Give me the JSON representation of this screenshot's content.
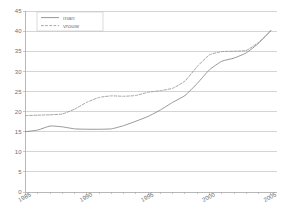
{
  "chart_data": {
    "type": "line",
    "title": "",
    "subtitle": "",
    "xlabel": "",
    "ylabel": "",
    "xlim": [
      1985,
      2005.5
    ],
    "ylim": [
      0,
      45
    ],
    "ytick_step": 5,
    "grid": true,
    "grid_axis": "y",
    "legend_position": "top-left",
    "x_tick_interval_minor": 1,
    "x_tick_interval_major": 5,
    "xticks": [
      1985,
      1990,
      1995,
      2000,
      2005
    ],
    "xtick_labels": [
      "1985",
      "1990",
      "1995",
      "2000",
      "2005"
    ],
    "yticks": [
      0,
      5,
      10,
      15,
      20,
      25,
      30,
      35,
      40,
      45
    ],
    "ytick_labels": [
      "0",
      "5",
      "10",
      "15",
      "20",
      "25",
      "30",
      "35",
      "40",
      "45"
    ],
    "x": [
      1985,
      1986,
      1987,
      1988,
      1989,
      1990,
      1991,
      1992,
      1993,
      1994,
      1995,
      1996,
      1997,
      1998,
      1999,
      2000,
      2001,
      2002,
      2003,
      2004,
      2005
    ],
    "series": [
      {
        "name": "man",
        "style": "solid",
        "color": "#8a8a8a",
        "values": [
          15.0,
          15.4,
          16.4,
          16.2,
          15.7,
          15.6,
          15.6,
          15.7,
          16.5,
          17.6,
          18.8,
          20.4,
          22.3,
          24.0,
          27.0,
          30.4,
          32.5,
          33.3,
          34.6,
          37.0,
          40.2
        ]
      },
      {
        "name": "vrouw",
        "style": "dashed",
        "color": "#9a9a9a",
        "values": [
          19.0,
          19.1,
          19.2,
          19.4,
          20.6,
          22.3,
          23.5,
          23.9,
          23.8,
          24.0,
          24.8,
          25.2,
          25.8,
          27.6,
          31.2,
          34.1,
          34.9,
          35.0,
          35.2,
          37.2,
          40.0
        ]
      }
    ]
  },
  "legend": {
    "items": [
      {
        "label": "man",
        "style": "solid"
      },
      {
        "label": "vrouw",
        "style": "dashed"
      }
    ]
  },
  "colors": {
    "background": "#ffffff",
    "grid": "#b9b9b9",
    "axis": "#9a9a9a",
    "text": "#6e6e6e",
    "series_man": "#8a8a8a",
    "series_vrouw": "#9a9a9a"
  }
}
